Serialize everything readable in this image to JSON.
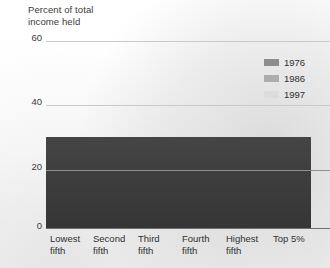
{
  "chart_data": {
    "type": "bar",
    "title": "Percent of total\nincome held",
    "xlabel": "",
    "ylabel": "Percent of total income held",
    "ylim": [
      0,
      60
    ],
    "yticks": [
      0,
      20,
      40,
      60
    ],
    "ytick_labels": [
      "0",
      "20",
      "40",
      "60"
    ],
    "grid": true,
    "legend_position": "top-right",
    "categories": [
      "Lowest\nfifth",
      "Second\nfifth",
      "Third\nfifth",
      "Fourth\nfifth",
      "Highest\nfifth",
      "Top 5%"
    ],
    "series": [
      {
        "name": "1976",
        "color": "#8d8d8d",
        "values": [
          4.4,
          10.4,
          17.1,
          24.8,
          43.3,
          15.6
        ]
      },
      {
        "name": "1986",
        "color": "#adadad",
        "values": [
          3.9,
          9.7,
          16.3,
          24.1,
          46.1,
          17.5
        ]
      },
      {
        "name": "1997",
        "color": "#dcdcdc",
        "values": [
          3.6,
          8.9,
          15.0,
          23.2,
          49.4,
          21.7
        ]
      }
    ]
  },
  "legend": {
    "items": [
      {
        "label": "1976"
      },
      {
        "label": "1986"
      },
      {
        "label": "1997"
      }
    ]
  },
  "colors": {
    "series_1976": "#8d8d8d",
    "series_1986": "#adadad",
    "series_1997": "#dcdcdc",
    "panel": "#3b3b3b",
    "background": "#ffffff"
  }
}
